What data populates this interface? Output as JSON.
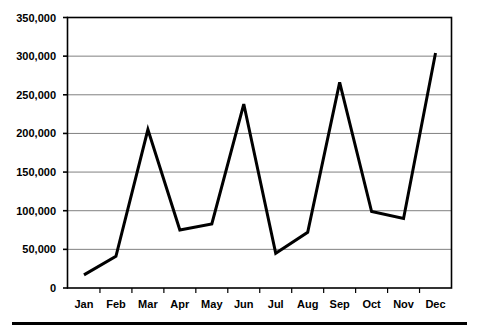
{
  "chart_data": {
    "type": "line",
    "title": "",
    "subtitle": "",
    "xlabel": "",
    "ylabel": "",
    "categories": [
      "Jan",
      "Feb",
      "Mar",
      "Apr",
      "May",
      "Jun",
      "Jul",
      "Aug",
      "Sep",
      "Oct",
      "Nov",
      "Dec"
    ],
    "values": [
      17000,
      41000,
      205000,
      75000,
      83000,
      238000,
      45000,
      72000,
      266000,
      99000,
      90000,
      304000
    ],
    "series": [
      {
        "name": "Series 1",
        "values": [
          17000,
          41000,
          205000,
          75000,
          83000,
          238000,
          45000,
          72000,
          266000,
          99000,
          90000,
          304000
        ]
      }
    ],
    "ylim": [
      0,
      350000
    ],
    "yticks": [
      0,
      50000,
      100000,
      150000,
      200000,
      250000,
      300000,
      350000
    ],
    "ytick_labels": [
      "0",
      "50,000",
      "100,000",
      "150,000",
      "200,000",
      "250,000",
      "300,000",
      "350,000"
    ],
    "grid": true,
    "grid_axis": "y",
    "legend": false,
    "legend_position": "none",
    "colors": {
      "line": "#000000",
      "grid": "#808080",
      "axis": "#000000",
      "background": "#FFFFFF",
      "text": "#000000"
    },
    "line_width": 3,
    "markers": false
  }
}
